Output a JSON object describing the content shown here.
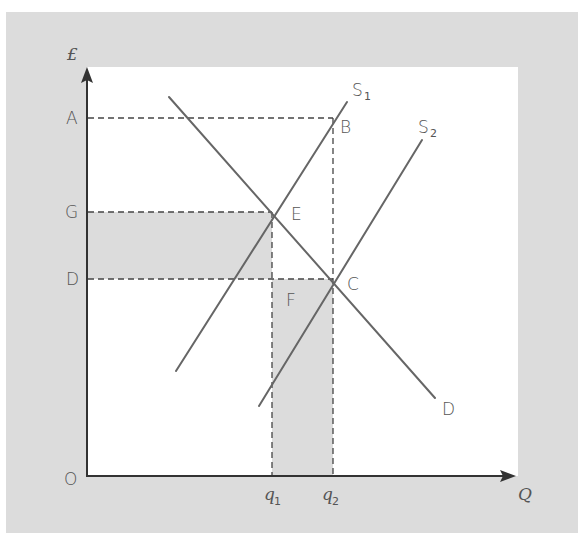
{
  "diagram": {
    "type": "supply-demand",
    "colors": {
      "frame": "#dcdcdc",
      "plot_bg": "#ffffff",
      "shade": "#dcdcdc",
      "axis": "#333333",
      "curve": "#666666",
      "dash": "#444444",
      "label": "#555555"
    },
    "axes": {
      "y_label": "£",
      "x_label": "Q",
      "origin_label": "O"
    },
    "price_levels": [
      {
        "label": "A",
        "y": 118
      },
      {
        "label": "G",
        "y": 212
      },
      {
        "label": "D",
        "y": 279
      }
    ],
    "quantity_levels": [
      {
        "label": "q",
        "sub": "1",
        "x": 272
      },
      {
        "label": "q",
        "sub": "2",
        "x": 333
      }
    ],
    "curves": [
      {
        "name": "D",
        "label": "D",
        "from": [
          169,
          97
        ],
        "to": [
          435,
          398
        ]
      },
      {
        "name": "S1",
        "label": "S",
        "sub": "1",
        "from": [
          176,
          371
        ],
        "to": [
          347,
          102
        ]
      },
      {
        "name": "S2",
        "label": "S",
        "sub": "2",
        "from": [
          259,
          406
        ],
        "to": [
          422,
          140
        ]
      }
    ],
    "points": [
      {
        "label": "B",
        "x": 333,
        "y": 118
      },
      {
        "label": "E",
        "x": 272,
        "y": 212
      },
      {
        "label": "C",
        "x": 333,
        "y": 279
      },
      {
        "label": "F",
        "x": 272,
        "y": 279
      }
    ],
    "shaded_regions": [
      {
        "name": "GEFD",
        "x": 87,
        "y": 212,
        "w": 185,
        "h": 67
      },
      {
        "name": "Fq1q2C",
        "x": 272,
        "y": 279,
        "w": 61,
        "h": 197
      }
    ]
  }
}
